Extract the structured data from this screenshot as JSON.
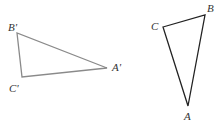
{
  "diagram": {
    "triangle_image": {
      "stroke": "#8a8a8a",
      "vertices": [
        {
          "name": "B'",
          "x": 17,
          "y": 33,
          "lx": 8,
          "ly": 31
        },
        {
          "name": "C'",
          "x": 22,
          "y": 77,
          "lx": 9,
          "ly": 92
        },
        {
          "name": "A'",
          "x": 107,
          "y": 68,
          "lx": 112,
          "ly": 71
        }
      ]
    },
    "triangle_original": {
      "stroke": "#222222",
      "vertices": [
        {
          "name": "C",
          "x": 163,
          "y": 27,
          "lx": 151,
          "ly": 30
        },
        {
          "name": "B",
          "x": 205,
          "y": 15,
          "lx": 207,
          "ly": 12
        },
        {
          "name": "A",
          "x": 188,
          "y": 106,
          "lx": 184,
          "ly": 120
        }
      ]
    }
  }
}
